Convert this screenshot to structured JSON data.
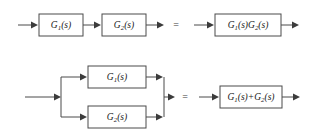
{
  "figure": {
    "background_color": "#ffffff",
    "line_color": "#4a4a4a",
    "text_color": "#1a1a1a",
    "width": 314,
    "height": 134
  },
  "relations": [
    {
      "id": "series",
      "name": "series-cascade-equivalence",
      "equals_symbol": "=",
      "left": {
        "blocks": [
          {
            "base": "G",
            "sub": "1",
            "arg": "(s)",
            "plain": "G1(s)"
          },
          {
            "base": "G",
            "sub": "2",
            "arg": "(s)",
            "plain": "G2(s)"
          }
        ]
      },
      "right": {
        "blocks": [
          {
            "plain": "G1(s)G2(s)",
            "parts": [
              {
                "base": "G",
                "sub": "1",
                "arg": "(s)"
              },
              {
                "base": "G",
                "sub": "2",
                "arg": "(s)"
              }
            ]
          }
        ]
      }
    },
    {
      "id": "parallel",
      "name": "parallel-sum-equivalence",
      "equals_symbol": "=",
      "left": {
        "blocks": [
          {
            "base": "G",
            "sub": "1",
            "arg": "(s)",
            "plain": "G1(s)"
          },
          {
            "base": "G",
            "sub": "2",
            "arg": "(s)",
            "plain": "G2(s)"
          }
        ]
      },
      "right": {
        "blocks": [
          {
            "plain": "G1(s)+G2(s)",
            "parts": [
              {
                "base": "G",
                "sub": "1",
                "arg": "(s)"
              },
              {
                "op": "+"
              },
              {
                "base": "G",
                "sub": "2",
                "arg": "(s)"
              }
            ]
          }
        ]
      }
    }
  ]
}
